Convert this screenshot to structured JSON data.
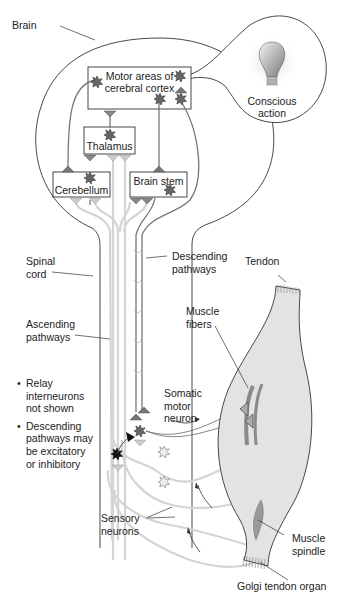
{
  "diagram": {
    "labels": {
      "brain": "Brain",
      "motor_cortex": "Motor areas of\ncerebral cortex",
      "conscious_action": "Conscious\naction",
      "thalamus": "Thalamus",
      "cerebellum": "Cerebellum",
      "brain_stem": "Brain stem",
      "spinal_cord": "Spinal\ncord",
      "descending_pathways": "Descending\npathways",
      "ascending_pathways": "Ascending\npathways",
      "tendon": "Tendon",
      "muscle_fibers": "Muscle\nfibers",
      "somatic_motor_neuron": "Somatic\nmotor\nneuron",
      "sensory_neurons": "Sensory\nneurons",
      "muscle_spindle": "Muscle\nspindle",
      "golgi_tendon_organ": "Golgi tendon organ"
    },
    "notes": [
      "Relay interneurons not shown",
      "Descending pathways may be excitatory or inhibitory"
    ],
    "icons": [
      "lightbulb-icon",
      "neuron-cell-body-icon",
      "axon-terminal-icon"
    ],
    "colors": {
      "outline": "#333333",
      "neuron_dark": "#555555",
      "pathway_light": "#d9d9d9",
      "muscle_fill": "#e3e3e3",
      "muscle_fiber": "#8a8a8a"
    }
  }
}
